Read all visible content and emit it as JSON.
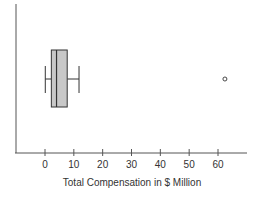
{
  "chart_data": {
    "type": "boxplot",
    "title": "",
    "xlabel": "Total Compensation in $ Million",
    "ylabel": "",
    "xlim": [
      -10,
      68
    ],
    "xticks": [
      0,
      10,
      20,
      30,
      40,
      50,
      60
    ],
    "xtick_labels": [
      "0",
      "10",
      "20",
      "30",
      "40",
      "50",
      "60"
    ],
    "grid": false,
    "legend": "none",
    "series": [
      {
        "name": "Total Compensation",
        "whisker_low": 0.1,
        "q1": 2.2,
        "median": 4.0,
        "q3": 7.7,
        "whisker_high": 11.8,
        "outliers": [
          62.4
        ]
      }
    ],
    "colors": {
      "box_fill": "#c8c8c8",
      "stroke": "#333333",
      "axis": "#555555"
    }
  }
}
